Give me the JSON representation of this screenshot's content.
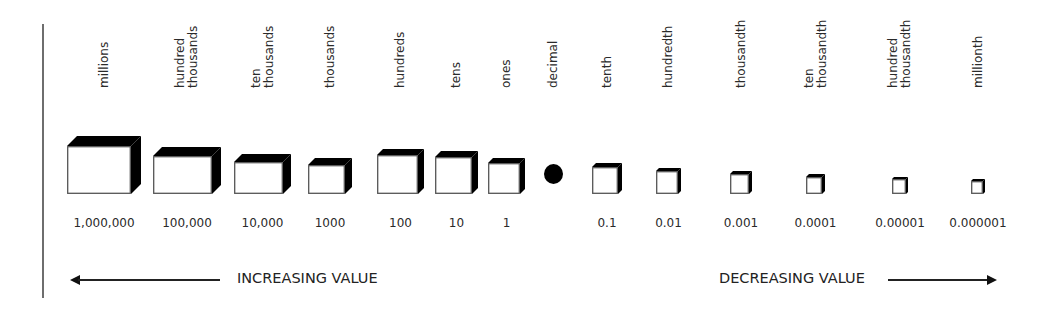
{
  "diagram": {
    "places": [
      {
        "name": "millions",
        "label_lines": "millions",
        "value": "1,000,000",
        "type": "cube",
        "x": 67,
        "w": 64,
        "h": 48,
        "d": 10
      },
      {
        "name": "hundred-thousands",
        "label_lines": "hundred\nthousands",
        "value": "100,000",
        "type": "cube",
        "x": 153,
        "w": 59,
        "h": 38,
        "d": 9
      },
      {
        "name": "ten-thousands",
        "label_lines": "ten\nthousands",
        "value": "10,000",
        "type": "cube",
        "x": 234,
        "w": 49,
        "h": 32,
        "d": 8
      },
      {
        "name": "thousands",
        "label_lines": "thousands",
        "value": "1000",
        "type": "cube",
        "x": 308,
        "w": 37,
        "h": 29,
        "d": 7
      },
      {
        "name": "hundreds",
        "label_lines": "hundreds",
        "value": "100",
        "type": "cube",
        "x": 377,
        "w": 41,
        "h": 39,
        "d": 6
      },
      {
        "name": "tens",
        "label_lines": "tens",
        "value": "10",
        "type": "cube",
        "x": 435,
        "w": 37,
        "h": 37,
        "d": 6
      },
      {
        "name": "ones",
        "label_lines": "ones",
        "value": "1",
        "type": "cube",
        "x": 488,
        "w": 32,
        "h": 31,
        "d": 5
      },
      {
        "name": "decimal",
        "label_lines": "decimal",
        "value": "",
        "type": "dot",
        "x": 553
      },
      {
        "name": "tenth",
        "label_lines": "tenth",
        "value": "0.1",
        "type": "cube",
        "x": 592,
        "w": 26,
        "h": 27,
        "d": 4
      },
      {
        "name": "hundredth",
        "label_lines": "hundredth",
        "value": "0.01",
        "type": "cube",
        "x": 656,
        "w": 22,
        "h": 23,
        "d": 3
      },
      {
        "name": "thousandth",
        "label_lines": "thousandth",
        "value": "0.001",
        "type": "cube",
        "x": 730,
        "w": 19,
        "h": 20,
        "d": 3
      },
      {
        "name": "ten-thousandth",
        "label_lines": "ten\nthousandth",
        "value": "0.0001",
        "type": "cube",
        "x": 806,
        "w": 16,
        "h": 17,
        "d": 3
      },
      {
        "name": "hundred-thousandth",
        "label_lines": "hundred\nthousandth",
        "value": "0.00001",
        "type": "cube",
        "x": 892,
        "w": 14,
        "h": 15,
        "d": 2
      },
      {
        "name": "millionth",
        "label_lines": "millionth",
        "value": "0.000001",
        "type": "cube",
        "x": 971,
        "w": 12,
        "h": 13,
        "d": 2
      }
    ],
    "left_arrow": {
      "label": "INCREASING VALUE",
      "direction": "left"
    },
    "right_arrow": {
      "label": "DECREASING VALUE",
      "direction": "right"
    },
    "colors": {
      "cube_face": "#ffffff",
      "cube_shadow": "#000000",
      "text": "#2a2a2a",
      "rule": "#6e6e6e"
    }
  }
}
